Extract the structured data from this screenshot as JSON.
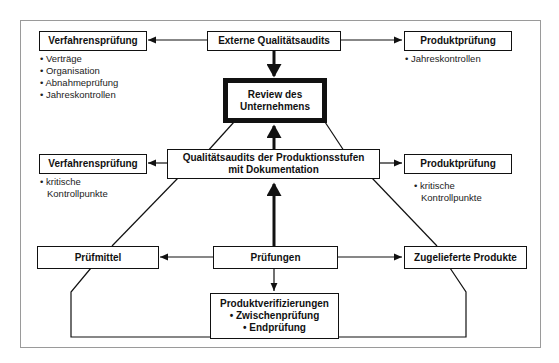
{
  "diagram": {
    "external_audits": "Externe Qualitätsaudits",
    "review": "Review des Unternehmens",
    "top_left": {
      "title": "Verfahrensprüfung",
      "items": [
        "Verträge",
        "Organisation",
        "Abnahmeprüfung",
        "Jahreskontrollen"
      ]
    },
    "top_right": {
      "title": "Produktprüfung",
      "items": [
        "Jahreskontrollen"
      ]
    },
    "stage_audits": {
      "line1": "Qualitätsaudits der Produktionsstufen",
      "line2": "mit Dokumentation"
    },
    "mid_left": {
      "title": "Verfahrensprüfung",
      "items": [
        "kritische",
        "Kontrollpunkte"
      ]
    },
    "mid_right": {
      "title": "Produktprüfung",
      "items": [
        "kritische",
        "Kontrollpunkte"
      ]
    },
    "test_equipment": "Prüfmittel",
    "tests": "Prüfungen",
    "supplied_products": "Zugelieferte Produkte",
    "product_verification": {
      "title": "Produktverifizierungen",
      "items": [
        "• Zwischenprüfung",
        "• Endprüfung"
      ]
    }
  }
}
